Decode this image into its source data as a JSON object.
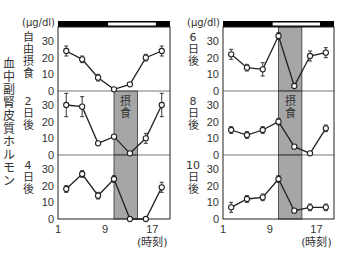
{
  "chart_data": {
    "type": "line",
    "title": "",
    "ylabel": "血中副腎皮質ホルモン",
    "unit": "(μg/dl)",
    "xlabel": "(時刻)",
    "x_ticks": [
      "1",
      "9",
      "17"
    ],
    "y_ticks": [
      "0",
      "10",
      "20",
      "30"
    ],
    "feeding_label": "摂食",
    "feeding_window": [
      10.5,
      14.5
    ],
    "light_dark_bar": {
      "dark_until": 9.5,
      "light_from": 9.5,
      "light_to": 18.0
    },
    "x": [
      2.4,
      5.1,
      7.8,
      10.5,
      13.2,
      15.9,
      18.6
    ],
    "panels": [
      {
        "name": "自由摂食",
        "column": "left",
        "row": 0,
        "values": [
          24,
          19,
          8,
          1,
          4,
          20,
          24
        ],
        "errors": [
          3,
          2,
          2,
          0,
          0,
          2,
          3
        ],
        "show_feeding": false
      },
      {
        "name": "2日後",
        "column": "left",
        "row": 1,
        "values": [
          30,
          29,
          7,
          11,
          1,
          10,
          30
        ],
        "errors": [
          7,
          6,
          1,
          1,
          0,
          3,
          7
        ],
        "show_feeding": true
      },
      {
        "name": "4日後",
        "column": "left",
        "row": 2,
        "values": [
          18,
          27,
          14,
          24,
          0,
          0,
          19
        ],
        "errors": [
          2,
          2,
          2,
          2,
          0,
          0,
          3
        ],
        "show_feeding": true
      },
      {
        "name": "6日後",
        "column": "right",
        "row": 0,
        "values": [
          22,
          14,
          13,
          33,
          3,
          21,
          23
        ],
        "errors": [
          3,
          2,
          4,
          2,
          0,
          3,
          3
        ],
        "show_feeding": true
      },
      {
        "name": "8日後",
        "column": "right",
        "row": 1,
        "values": [
          15,
          12,
          15,
          20,
          5,
          1,
          16
        ],
        "errors": [
          2,
          2,
          2,
          2,
          0,
          0,
          2
        ],
        "show_feeding": true
      },
      {
        "name": "10日後",
        "column": "right",
        "row": 2,
        "values": [
          7,
          12,
          13,
          24,
          5,
          7,
          7
        ],
        "errors": [
          3,
          2,
          2,
          2,
          1,
          2,
          2
        ],
        "show_feeding": true
      }
    ],
    "ylim": [
      0,
      33
    ],
    "xlim": [
      1,
      19.5
    ],
    "grid": false,
    "colors": {
      "line": "#222222",
      "feeding_band": "#a6a6a6",
      "dark_bar": "#000000",
      "light_bar": "#ffffff"
    }
  }
}
